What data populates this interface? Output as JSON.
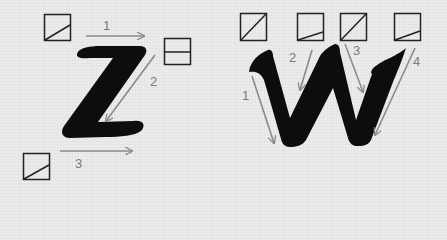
{
  "diagram": {
    "colors": {
      "background": "#ececec",
      "letter": "#0d0d0d",
      "arrow": "#8a8a8a",
      "box": "#222222"
    },
    "letters": [
      {
        "glyph": "Z",
        "strokes": [
          {
            "number": "1",
            "direction": "left-to-right"
          },
          {
            "number": "2",
            "direction": "diagonal down-left"
          },
          {
            "number": "3",
            "direction": "left-to-right"
          }
        ],
        "pen_angle_boxes": [
          "shallow diagonal",
          "horizontal split",
          "shallow diagonal"
        ]
      },
      {
        "glyph": "W",
        "strokes": [
          {
            "number": "1",
            "direction": "down"
          },
          {
            "number": "2",
            "direction": "down-left"
          },
          {
            "number": "3",
            "direction": "down"
          },
          {
            "number": "4",
            "direction": "down-left"
          }
        ],
        "pen_angle_boxes": [
          "steep diagonal",
          "shallow diagonal",
          "steep diagonal",
          "shallow diagonal"
        ]
      }
    ],
    "labels": {
      "z1": "1",
      "z2": "2",
      "z3": "3",
      "w1": "1",
      "w2": "2",
      "w3": "3",
      "w4": "4"
    }
  }
}
